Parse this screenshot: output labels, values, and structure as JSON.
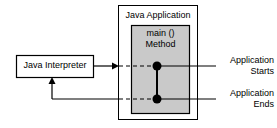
{
  "diagram": {
    "title": "Java Application",
    "outer_box": {
      "label": "Java Application",
      "fill": "#ffffff",
      "stroke": "#000000"
    },
    "inner_box": {
      "label_line1": "main ()",
      "label_line2": "Method",
      "fill": "#c9c9c9",
      "stroke": "#000000"
    },
    "interpreter_box": {
      "label": "Java Interpreter",
      "fill": "#ffffff",
      "stroke": "#000000"
    },
    "annotations": [
      {
        "line1": "Application",
        "line2": "Starts"
      },
      {
        "line1": "Application",
        "line2": "Ends"
      }
    ],
    "nodes": [
      {
        "name": "start-point",
        "fill": "#000000"
      },
      {
        "name": "end-point",
        "fill": "#000000"
      }
    ]
  }
}
